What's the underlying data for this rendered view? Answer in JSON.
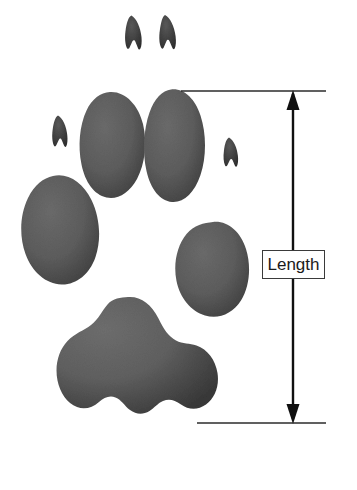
{
  "diagram": {
    "background_color": "#ffffff",
    "pad_fill_color": "#5e5e5e",
    "pad_edge_color": "#3d3d3d",
    "line_color": "#1a1a1a"
  },
  "annotation": {
    "label": "Length",
    "label_box": {
      "border_color": "#3a3a3a",
      "background_color": "#ffffff"
    },
    "arrow": {
      "orientation": "vertical",
      "style": "double-headed",
      "top_head": "arrow-up",
      "bottom_head": "arrow-down"
    },
    "reference_lines": [
      {
        "name": "top-extension-line",
        "position": "top"
      },
      {
        "name": "bottom-extension-line",
        "position": "bottom"
      }
    ]
  },
  "paw": {
    "claw_count": 4,
    "toe_pad_count": 4,
    "metacarpal_pad_count": 1,
    "claws": [
      {
        "name": "claw-front-left"
      },
      {
        "name": "claw-front-right"
      },
      {
        "name": "claw-outer-left"
      },
      {
        "name": "claw-outer-right"
      }
    ],
    "toe_pads": [
      {
        "name": "toe-pad-inner-left"
      },
      {
        "name": "toe-pad-inner-right"
      },
      {
        "name": "toe-pad-outer-left"
      },
      {
        "name": "toe-pad-outer-right"
      }
    ],
    "main_pad": {
      "name": "metacarpal-pad"
    }
  }
}
